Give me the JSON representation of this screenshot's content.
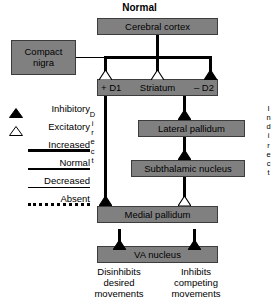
{
  "title": "Normal",
  "boxes": {
    "cerebral_cortex": "Cerebral cortex",
    "compact_nigra_line1": "Compact",
    "compact_nigra_line2": "nigra",
    "striatum": "Striatum",
    "striatum_left_receptor": "+ D1",
    "striatum_right_receptor": "– D2",
    "lateral_pallidum": "Lateral pallidum",
    "subthalamic_nucleus": "Subthalamic nucleus",
    "medial_pallidum": "Medial pallidum",
    "va_nucleus": "VA nucleus"
  },
  "pathways": {
    "direct": "Direct",
    "indirect": "Indirect"
  },
  "legend": {
    "symbols": [
      {
        "label": "Inhibitory",
        "glyph": "filled-triangle-icon"
      },
      {
        "label": "Excitatory",
        "glyph": "open-triangle-icon"
      }
    ],
    "levels": [
      {
        "label": "Increased",
        "weight": "thick"
      },
      {
        "label": "Normal",
        "weight": "medium"
      },
      {
        "label": "Decreased",
        "weight": "thin"
      },
      {
        "label": "Absent",
        "weight": "dotted"
      }
    ]
  },
  "outcomes": {
    "left": "Disinhibits\ndesired\nmovements",
    "left_line1": "Disinhibits",
    "left_line2": "desired",
    "left_line3": "movements",
    "right_line1": "Inhibits",
    "right_line2": "competing",
    "right_line3": "movements"
  },
  "colors": {
    "box_fill": "#808080",
    "box_border": "#3c3c3c",
    "line": "#000000",
    "background": "#ffffff",
    "inhibitory_fill": "#000000",
    "excitatory_fill": "#ffffff"
  }
}
